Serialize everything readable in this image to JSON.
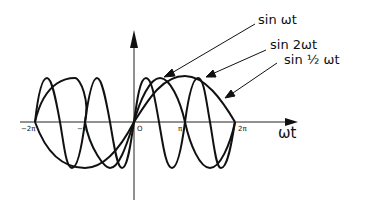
{
  "diagram": {
    "type": "waveform-comparison",
    "axes": {
      "x_label": "ωt",
      "ticks": [
        "−2π",
        "−π",
        "O",
        "π",
        "2π"
      ]
    },
    "curves": [
      {
        "label": "sin ωt"
      },
      {
        "label": "sin 2ωt"
      },
      {
        "label": "sin ½ ωt"
      }
    ],
    "stroke_color": "#111111"
  }
}
